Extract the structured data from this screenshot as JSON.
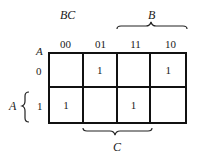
{
  "kmap": {
    "row_var": "A",
    "col_var": "BC",
    "col_headers": [
      "00",
      "01",
      "11",
      "10"
    ],
    "row_headers": [
      "0",
      "1"
    ],
    "cells": [
      [
        "",
        "1",
        "",
        "1"
      ],
      [
        "1",
        "",
        "1",
        ""
      ]
    ],
    "brace_top_label": "B",
    "brace_left_label": "A",
    "brace_bottom_label": "C"
  }
}
